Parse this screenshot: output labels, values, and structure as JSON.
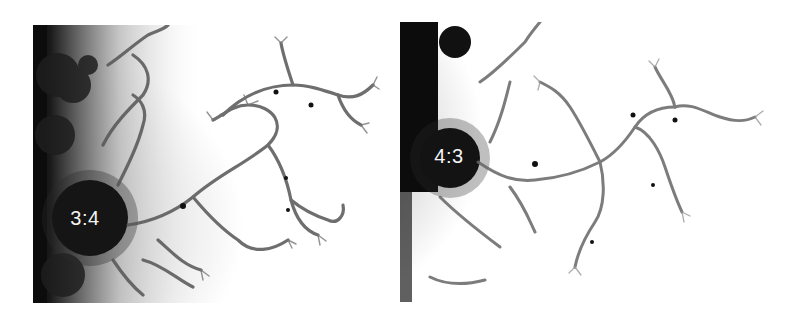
{
  "figure": {
    "panels": [
      {
        "id": "left",
        "label": "3:4",
        "description": "Mandelbrot set close-up near 3:4 bulb"
      },
      {
        "id": "right",
        "label": "4:3",
        "description": "Mandelbrot set close-up near 4:3 bulb"
      }
    ],
    "colors": {
      "background": "#ffffff",
      "set": "#0a0a0a",
      "filament": "#6a6a6a",
      "halo": "#cfcfcf",
      "label": "#f4f4f4"
    }
  }
}
